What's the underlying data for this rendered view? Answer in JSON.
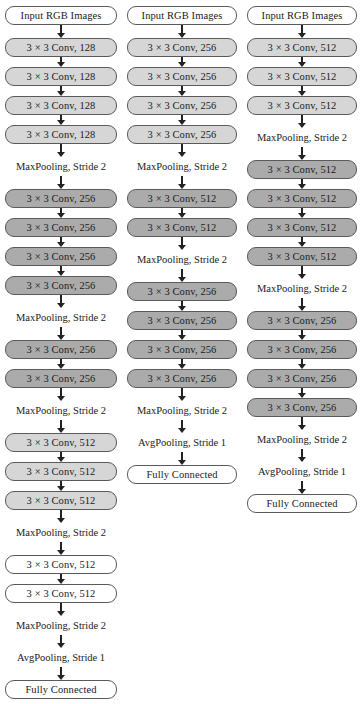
{
  "diagram": {
    "type": "flowchart",
    "orientation": "top-to-bottom",
    "colors": {
      "fill_none": "#ffffff",
      "fill_light": "#d6d6d6",
      "fill_dark": "#ababab",
      "stroke": "#5a5a5a",
      "arrow": "#222222",
      "text": "#1a1a1a"
    },
    "legend_note": "Three parallel network columns; rounded boxes are layers, plain text are pooling operations.",
    "columns": [
      {
        "name": "column-1",
        "nodes": [
          {
            "label": "Input RGB Images",
            "shape": "box",
            "fill": "none",
            "arrow_after": "m"
          },
          {
            "label": "3 × 3 Conv, 128",
            "shape": "box",
            "fill": "light",
            "arrow_after": "s"
          },
          {
            "label": "3 × 3 Conv, 128",
            "shape": "box",
            "fill": "light",
            "arrow_after": "s"
          },
          {
            "label": "3 × 3 Conv, 128",
            "shape": "box",
            "fill": "light",
            "arrow_after": "s"
          },
          {
            "label": "3 × 3 Conv, 128",
            "shape": "box",
            "fill": "light",
            "arrow_after": "m"
          },
          {
            "label": "MaxPooling, Stride 2",
            "shape": "plain",
            "fill": "none",
            "arrow_after": "m"
          },
          {
            "label": "3 × 3 Conv, 256",
            "shape": "box",
            "fill": "dark",
            "arrow_after": "s"
          },
          {
            "label": "3 × 3 Conv, 256",
            "shape": "box",
            "fill": "dark",
            "arrow_after": "s"
          },
          {
            "label": "3 × 3 Conv, 256",
            "shape": "box",
            "fill": "dark",
            "arrow_after": "s"
          },
          {
            "label": "3 × 3 Conv, 256",
            "shape": "box",
            "fill": "dark",
            "arrow_after": "m"
          },
          {
            "label": "MaxPooling, Stride 2",
            "shape": "plain",
            "fill": "none",
            "arrow_after": "m"
          },
          {
            "label": "3 × 3 Conv, 256",
            "shape": "box",
            "fill": "dark",
            "arrow_after": "s"
          },
          {
            "label": "3 × 3 Conv, 256",
            "shape": "box",
            "fill": "dark",
            "arrow_after": "m"
          },
          {
            "label": "MaxPooling, Stride 2",
            "shape": "plain",
            "fill": "none",
            "arrow_after": "m"
          },
          {
            "label": "3 × 3 Conv, 512",
            "shape": "box",
            "fill": "light",
            "arrow_after": "s"
          },
          {
            "label": "3 × 3 Conv, 512",
            "shape": "box",
            "fill": "light",
            "arrow_after": "s"
          },
          {
            "label": "3 × 3 Conv, 512",
            "shape": "box",
            "fill": "light",
            "arrow_after": "m"
          },
          {
            "label": "MaxPooling, Stride 2",
            "shape": "plain",
            "fill": "none",
            "arrow_after": "m"
          },
          {
            "label": "3 × 3 Conv, 512",
            "shape": "box",
            "fill": "none",
            "arrow_after": "s"
          },
          {
            "label": "3 × 3 Conv, 512",
            "shape": "box",
            "fill": "none",
            "arrow_after": "m"
          },
          {
            "label": "MaxPooling, Stride 2",
            "shape": "plain",
            "fill": "none",
            "arrow_after": "m"
          },
          {
            "label": "AvgPooling, Stride 1",
            "shape": "plain",
            "fill": "none",
            "arrow_after": "m"
          },
          {
            "label": "Fully Connected",
            "shape": "box",
            "fill": "none",
            "arrow_after": "none"
          }
        ]
      },
      {
        "name": "column-2",
        "nodes": [
          {
            "label": "Input RGB Images",
            "shape": "box",
            "fill": "none",
            "arrow_after": "m"
          },
          {
            "label": "3 × 3 Conv, 256",
            "shape": "box",
            "fill": "light",
            "arrow_after": "s"
          },
          {
            "label": "3 × 3 Conv, 256",
            "shape": "box",
            "fill": "light",
            "arrow_after": "s"
          },
          {
            "label": "3 × 3 Conv, 256",
            "shape": "box",
            "fill": "light",
            "arrow_after": "s"
          },
          {
            "label": "3 × 3 Conv, 256",
            "shape": "box",
            "fill": "light",
            "arrow_after": "m"
          },
          {
            "label": "MaxPooling, Stride 2",
            "shape": "plain",
            "fill": "none",
            "arrow_after": "m"
          },
          {
            "label": "3 × 3 Conv, 512",
            "shape": "box",
            "fill": "dark",
            "arrow_after": "s"
          },
          {
            "label": "3 × 3 Conv, 512",
            "shape": "box",
            "fill": "dark",
            "arrow_after": "m"
          },
          {
            "label": "MaxPooling, Stride 2",
            "shape": "plain",
            "fill": "none",
            "arrow_after": "m"
          },
          {
            "label": "3 × 3 Conv, 256",
            "shape": "box",
            "fill": "dark",
            "arrow_after": "s"
          },
          {
            "label": "3 × 3 Conv, 256",
            "shape": "box",
            "fill": "dark",
            "arrow_after": "s"
          },
          {
            "label": "3 × 3 Conv, 256",
            "shape": "box",
            "fill": "dark",
            "arrow_after": "s"
          },
          {
            "label": "3 × 3 Conv, 256",
            "shape": "box",
            "fill": "dark",
            "arrow_after": "m"
          },
          {
            "label": "MaxPooling, Stride 2",
            "shape": "plain",
            "fill": "none",
            "arrow_after": "m"
          },
          {
            "label": "AvgPooling, Stride 1",
            "shape": "plain",
            "fill": "none",
            "arrow_after": "m"
          },
          {
            "label": "Fully Connected",
            "shape": "box",
            "fill": "none",
            "arrow_after": "none"
          }
        ]
      },
      {
        "name": "column-3",
        "nodes": [
          {
            "label": "Input RGB Images",
            "shape": "box",
            "fill": "none",
            "arrow_after": "m"
          },
          {
            "label": "3 × 3 Conv, 512",
            "shape": "box",
            "fill": "light",
            "arrow_after": "s"
          },
          {
            "label": "3 × 3 Conv, 512",
            "shape": "box",
            "fill": "light",
            "arrow_after": "s"
          },
          {
            "label": "3 × 3 Conv, 512",
            "shape": "box",
            "fill": "light",
            "arrow_after": "m"
          },
          {
            "label": "MaxPooling, Stride 2",
            "shape": "plain",
            "fill": "none",
            "arrow_after": "m"
          },
          {
            "label": "3 × 3 Conv, 512",
            "shape": "box",
            "fill": "dark",
            "arrow_after": "s"
          },
          {
            "label": "3 × 3 Conv, 512",
            "shape": "box",
            "fill": "dark",
            "arrow_after": "s"
          },
          {
            "label": "3 × 3 Conv, 512",
            "shape": "box",
            "fill": "dark",
            "arrow_after": "s"
          },
          {
            "label": "3 × 3 Conv, 512",
            "shape": "box",
            "fill": "dark",
            "arrow_after": "m"
          },
          {
            "label": "MaxPooling, Stride 2",
            "shape": "plain",
            "fill": "none",
            "arrow_after": "m"
          },
          {
            "label": "3 × 3 Conv, 256",
            "shape": "box",
            "fill": "dark",
            "arrow_after": "s"
          },
          {
            "label": "3 × 3 Conv, 256",
            "shape": "box",
            "fill": "dark",
            "arrow_after": "s"
          },
          {
            "label": "3 × 3 Conv, 256",
            "shape": "box",
            "fill": "dark",
            "arrow_after": "s"
          },
          {
            "label": "3 × 3 Conv, 256",
            "shape": "box",
            "fill": "dark",
            "arrow_after": "m"
          },
          {
            "label": "MaxPooling, Stride 2",
            "shape": "plain",
            "fill": "none",
            "arrow_after": "m"
          },
          {
            "label": "AvgPooling, Stride 1",
            "shape": "plain",
            "fill": "none",
            "arrow_after": "m"
          },
          {
            "label": "Fully Connected",
            "shape": "box",
            "fill": "none",
            "arrow_after": "none"
          }
        ]
      }
    ]
  }
}
